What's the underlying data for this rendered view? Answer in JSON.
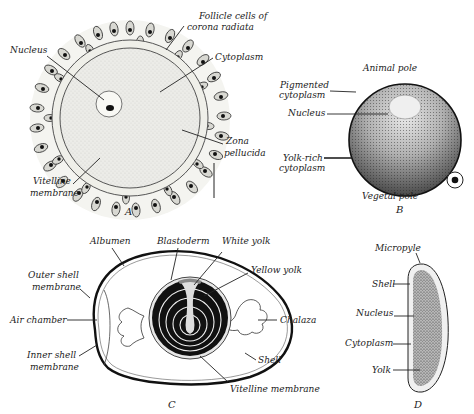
{
  "figure": {
    "panels": [
      {
        "id": "A",
        "letter": "A",
        "labels": {
          "follicle_1": "Follicle cells of",
          "follicle_2": "corona radiata",
          "nucleus": "Nucleus",
          "cytoplasm": "Cytoplasm",
          "zona_1": "Zona",
          "zona_2": "pellucida",
          "vitelline_1": "Vitelline",
          "vitelline_2": "membrane"
        }
      },
      {
        "id": "B",
        "letter": "B",
        "labels": {
          "animal_pole": "Animal pole",
          "pigmented_1": "Pigmented",
          "pigmented_2": "cytoplasm",
          "nucleus": "Nucleus",
          "yolk_1": "Yolk-rich",
          "yolk_2": "cytoplasm",
          "vegetal_pole": "Vegetal pole"
        }
      },
      {
        "id": "C",
        "letter": "C",
        "labels": {
          "albumen": "Albumen",
          "blastoderm": "Blastoderm",
          "white_yolk": "White yolk",
          "yellow_yolk": "Yellow yolk",
          "outer_shell_1": "Outer shell",
          "outer_shell_2": "membrane",
          "air_chamber": "Air chamber",
          "inner_shell_1": "Inner shell",
          "inner_shell_2": "membrane",
          "chalaza": "Chalaza",
          "shell": "Shell",
          "vitelline": "Vitelline membrane"
        }
      },
      {
        "id": "D",
        "letter": "D",
        "labels": {
          "micropyle": "Micropyle",
          "shell": "Shell",
          "nucleus": "Nucleus",
          "cytoplasm": "Cytoplasm",
          "yolk": "Yolk"
        }
      }
    ],
    "colors": {
      "ink": "#222222",
      "cytoplasm_fill": "#e6e6e2",
      "yolk_black": "#111111",
      "paper": "#ffffff"
    }
  }
}
